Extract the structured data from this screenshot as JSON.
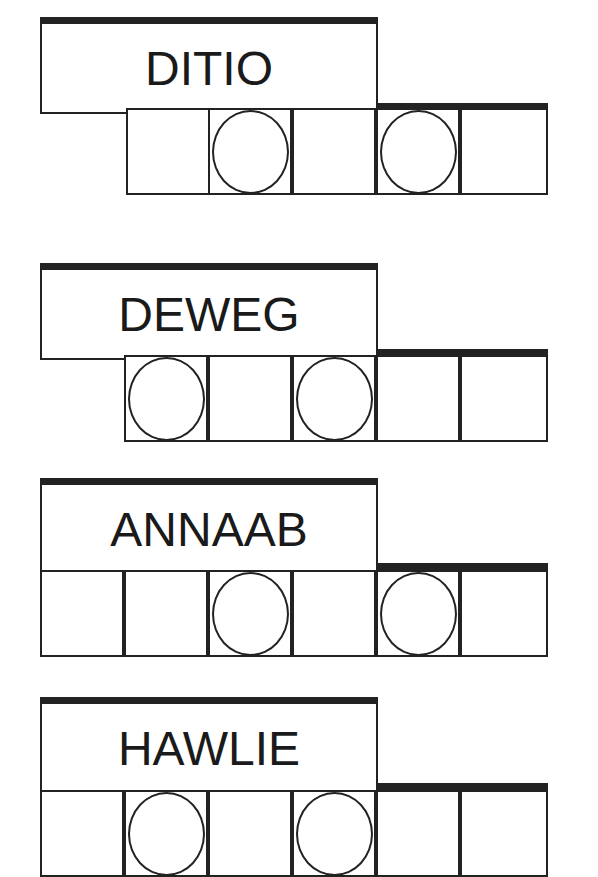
{
  "puzzles": [
    {
      "scrambled_word": "DITIO",
      "cell_count": 5,
      "circled_positions": [
        2,
        4
      ],
      "cells": [
        {
          "index": 1,
          "circled": false
        },
        {
          "index": 2,
          "circled": true
        },
        {
          "index": 3,
          "circled": false
        },
        {
          "index": 4,
          "circled": true
        },
        {
          "index": 5,
          "circled": false
        }
      ]
    },
    {
      "scrambled_word": "DEWEG",
      "cell_count": 5,
      "circled_positions": [
        1,
        3
      ],
      "cells": [
        {
          "index": 1,
          "circled": true
        },
        {
          "index": 2,
          "circled": false
        },
        {
          "index": 3,
          "circled": true
        },
        {
          "index": 4,
          "circled": false
        },
        {
          "index": 5,
          "circled": false
        }
      ]
    },
    {
      "scrambled_word": "ANNAAB",
      "cell_count": 6,
      "circled_positions": [
        3,
        5
      ],
      "cells": [
        {
          "index": 1,
          "circled": false
        },
        {
          "index": 2,
          "circled": false
        },
        {
          "index": 3,
          "circled": true
        },
        {
          "index": 4,
          "circled": false
        },
        {
          "index": 5,
          "circled": true
        },
        {
          "index": 6,
          "circled": false
        }
      ]
    },
    {
      "scrambled_word": "HAWLIE",
      "cell_count": 6,
      "circled_positions": [
        2,
        4
      ],
      "cells": [
        {
          "index": 1,
          "circled": false
        },
        {
          "index": 2,
          "circled": true
        },
        {
          "index": 3,
          "circled": false
        },
        {
          "index": 4,
          "circled": true
        },
        {
          "index": 5,
          "circled": false
        },
        {
          "index": 6,
          "circled": false
        }
      ]
    }
  ]
}
